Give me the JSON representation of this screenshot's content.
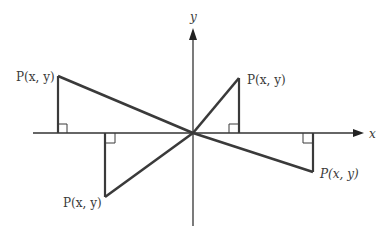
{
  "diagram": {
    "axes": {
      "x_label": "x",
      "y_label": "y",
      "color": "#333333"
    },
    "stroke_color": "#3a3a3a",
    "points": [
      {
        "quadrant": "II",
        "label": "P(x, y)"
      },
      {
        "quadrant": "I",
        "label": "P(x, y)"
      },
      {
        "quadrant": "III",
        "label": "P(x, y)"
      },
      {
        "quadrant": "IV",
        "label": "P(x, y)"
      }
    ]
  }
}
